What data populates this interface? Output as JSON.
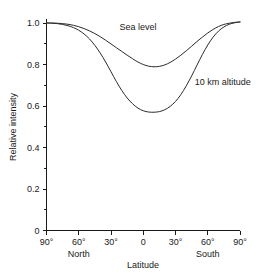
{
  "chart_data": {
    "type": "line",
    "title": "",
    "xlabel": "Latitude",
    "ylabel": "Relative intensity",
    "xlim": [
      -90,
      90
    ],
    "ylim": [
      0,
      1.05
    ],
    "grid": false,
    "legend_position": "inline-annotation",
    "x_tick_labels": [
      "90°",
      "60°",
      "30°",
      "0",
      "30°",
      "60°",
      "90°"
    ],
    "x_tick_values": [
      -90,
      -60,
      -30,
      0,
      30,
      60,
      90
    ],
    "x_hemisphere_labels": [
      {
        "text": "North",
        "at": -60
      },
      {
        "text": "South",
        "at": 60
      }
    ],
    "y_tick_labels": [
      "0",
      "0.2",
      "0.4",
      "0.6",
      "0.8",
      "1.0"
    ],
    "y_tick_values": [
      0,
      0.2,
      0.4,
      0.6,
      0.8,
      1.0
    ],
    "y_minor_tick_values": [
      0.1,
      0.3,
      0.5,
      0.7,
      0.9
    ],
    "series": [
      {
        "name": "Sea level",
        "label": "Sea level",
        "label_at": {
          "x": -22,
          "y": 0.965
        },
        "color": "#2b2b2b",
        "x": [
          -90,
          -85,
          -80,
          -75,
          -70,
          -65,
          -60,
          -55,
          -50,
          -45,
          -40,
          -35,
          -30,
          -25,
          -20,
          -15,
          -10,
          -5,
          0,
          5,
          10,
          15,
          20,
          25,
          30,
          35,
          40,
          45,
          50,
          55,
          60,
          65,
          70,
          75,
          80,
          85,
          90
        ],
        "values": [
          1.0,
          1.0,
          0.999,
          0.997,
          0.994,
          0.989,
          0.982,
          0.973,
          0.962,
          0.949,
          0.934,
          0.917,
          0.899,
          0.881,
          0.863,
          0.845,
          0.828,
          0.812,
          0.8,
          0.792,
          0.789,
          0.791,
          0.798,
          0.81,
          0.826,
          0.845,
          0.866,
          0.888,
          0.911,
          0.932,
          0.952,
          0.969,
          0.983,
          0.993,
          0.999,
          1.003,
          1.005
        ]
      },
      {
        "name": "10 km altitude",
        "label": "10 km altitude",
        "label_at": {
          "x": 48,
          "y": 0.7
        },
        "color": "#2b2b2b",
        "x": [
          -90,
          -85,
          -80,
          -75,
          -70,
          -65,
          -60,
          -55,
          -50,
          -45,
          -40,
          -35,
          -30,
          -25,
          -20,
          -15,
          -10,
          -5,
          0,
          5,
          10,
          15,
          20,
          25,
          30,
          35,
          40,
          45,
          50,
          55,
          60,
          65,
          70,
          75,
          80,
          85,
          90
        ],
        "values": [
          1.0,
          0.999,
          0.997,
          0.993,
          0.987,
          0.978,
          0.965,
          0.947,
          0.923,
          0.892,
          0.855,
          0.812,
          0.765,
          0.718,
          0.675,
          0.639,
          0.611,
          0.59,
          0.577,
          0.571,
          0.57,
          0.573,
          0.582,
          0.598,
          0.622,
          0.655,
          0.697,
          0.745,
          0.797,
          0.848,
          0.894,
          0.932,
          0.961,
          0.981,
          0.994,
          1.001,
          1.005
        ]
      }
    ]
  },
  "axis_titles": {
    "x": "Latitude",
    "y": "Relative intensity"
  }
}
